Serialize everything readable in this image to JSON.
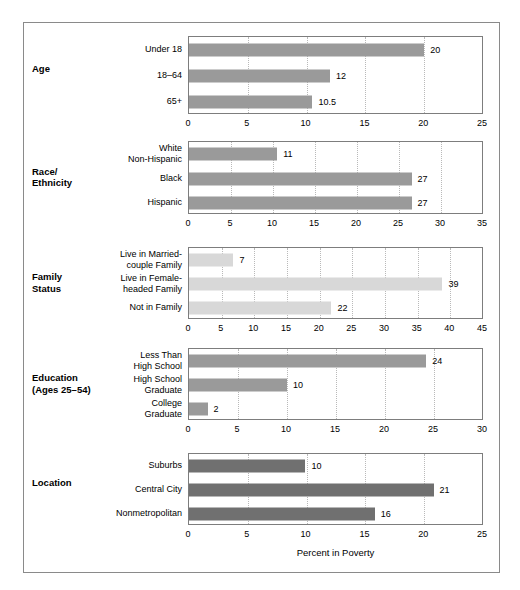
{
  "figure": {
    "axis_title": "Percent in Poverty",
    "colors": {
      "border": "#8a8a8a",
      "plot_border": "#7d7d7d",
      "gridline": "#b9b9b9",
      "bar_medium": "#9a9a9a",
      "bar_light": "#d8d8d8",
      "bar_dark": "#707070"
    }
  },
  "chart_data": {
    "type": "bar",
    "title": "",
    "xlabel": "Percent in Poverty",
    "ylabel": "",
    "grid": true,
    "orientation": "horizontal",
    "panels": [
      {
        "group": "Age",
        "bar_color": "#9a9a9a",
        "xlim": [
          0,
          25
        ],
        "xticks": [
          0,
          5,
          10,
          15,
          20,
          25
        ],
        "categories": [
          "Under 18",
          "18–64",
          "65+"
        ],
        "values": [
          20,
          12,
          10.5
        ],
        "labels": [
          "20",
          "12",
          "10.5"
        ]
      },
      {
        "group": "Race/\nEthnicity",
        "bar_color": "#9a9a9a",
        "xlim": [
          0,
          35
        ],
        "xticks": [
          0,
          5,
          10,
          15,
          20,
          25,
          30,
          35
        ],
        "categories": [
          "White\nNon-Hispanic",
          "Black",
          "Hispanic"
        ],
        "values": [
          10.5,
          26.5,
          26.5
        ],
        "labels": [
          "11",
          "27",
          "27"
        ]
      },
      {
        "group": "Family\nStatus",
        "bar_color": "#d8d8d8",
        "xlim": [
          0,
          45
        ],
        "xticks": [
          0,
          5,
          10,
          15,
          20,
          25,
          30,
          35,
          40,
          45
        ],
        "categories": [
          "Live in Married-\ncouple Family",
          "Live in Female-\nheaded Family",
          "Not in Family"
        ],
        "values": [
          6.8,
          38.8,
          21.8
        ],
        "labels": [
          "7",
          "39",
          "22"
        ]
      },
      {
        "group": "Education\n(Ages 25–54)",
        "bar_color": "#9a9a9a",
        "xlim": [
          0,
          30
        ],
        "xticks": [
          0,
          5,
          10,
          15,
          20,
          25,
          30
        ],
        "categories": [
          "Less Than\nHigh School",
          "High School\nGraduate",
          "College\nGraduate"
        ],
        "values": [
          24.2,
          10,
          1.9
        ],
        "labels": [
          "24",
          "10",
          "2"
        ]
      },
      {
        "group": "Location",
        "bar_color": "#707070",
        "xlim": [
          0,
          25
        ],
        "xticks": [
          0,
          5,
          10,
          15,
          20,
          25
        ],
        "categories": [
          "Suburbs",
          "Central City",
          "Nonmetropolitan"
        ],
        "values": [
          9.9,
          20.8,
          15.8
        ],
        "labels": [
          "10",
          "21",
          "16"
        ]
      }
    ]
  }
}
